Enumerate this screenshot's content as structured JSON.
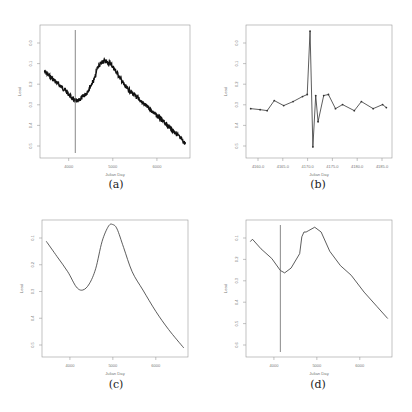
{
  "chart_data": [
    {
      "id": "a",
      "type": "line",
      "caption": "(a)",
      "title": "",
      "xlabel": "Julian Day",
      "ylabel": "Lead",
      "x_ticks": [
        "4000",
        "5000",
        "6000"
      ],
      "y_ticks": [
        "0.0",
        "0.1",
        "0.2",
        "0.3",
        "0.4",
        "0.5"
      ],
      "grid": false,
      "noisy": true,
      "vline_x": 4150,
      "xlim": [
        3350,
        6750
      ],
      "ylim": [
        0.58,
        -0.08
      ],
      "x": [
        3450,
        3700,
        3950,
        4100,
        4200,
        4400,
        4600,
        4650,
        4800,
        4950,
        5100,
        5300,
        5550,
        5800,
        6100,
        6400,
        6650
      ],
      "values": [
        0.15,
        0.2,
        0.25,
        0.29,
        0.3,
        0.26,
        0.18,
        0.13,
        0.1,
        0.11,
        0.16,
        0.23,
        0.28,
        0.33,
        0.39,
        0.45,
        0.51
      ]
    },
    {
      "id": "b",
      "type": "line",
      "caption": "(b)",
      "title": "",
      "xlabel": "Julian Day",
      "ylabel": "Lead",
      "x_ticks": [
        "4160.0",
        "4165.0",
        "4170.0",
        "4175.0",
        "4180.0",
        "4185.0"
      ],
      "y_ticks": [
        "0.0",
        "0.1",
        "0.2",
        "0.3",
        "0.4",
        "0.5"
      ],
      "grid": false,
      "markers": true,
      "xlim": [
        4157,
        4188
      ],
      "ylim": [
        0.58,
        -0.08
      ],
      "x": [
        4158,
        4160,
        4161.5,
        4163,
        4165,
        4167,
        4169,
        4170,
        4170.6,
        4171.2,
        4171.8,
        4172.3,
        4173.5,
        4174.5,
        4176,
        4177.5,
        4180,
        4181.5,
        4184,
        4186,
        4186.8
      ],
      "values": [
        0.335,
        0.34,
        0.345,
        0.295,
        0.32,
        0.3,
        0.275,
        0.265,
        -0.05,
        0.525,
        0.27,
        0.4,
        0.27,
        0.265,
        0.335,
        0.315,
        0.345,
        0.3,
        0.335,
        0.315,
        0.33
      ]
    },
    {
      "id": "c",
      "type": "line",
      "caption": "(c)",
      "title": "",
      "xlabel": "Julian Day",
      "ylabel": "Lead",
      "x_ticks": [
        "4000",
        "5000",
        "6000"
      ],
      "y_ticks": [
        "0.1",
        "0.2",
        "0.3",
        "0.4",
        "0.5"
      ],
      "grid": false,
      "smooth": true,
      "xlim": [
        3350,
        6750
      ],
      "ylim": [
        0.52,
        0.07
      ],
      "x": [
        3450,
        3700,
        3950,
        4150,
        4300,
        4450,
        4600,
        4750,
        4900,
        5000,
        5100,
        5250,
        5450,
        5700,
        6000,
        6300,
        6650
      ],
      "values": [
        0.14,
        0.19,
        0.24,
        0.29,
        0.3,
        0.28,
        0.23,
        0.14,
        0.09,
        0.085,
        0.1,
        0.16,
        0.24,
        0.3,
        0.37,
        0.43,
        0.49
      ]
    },
    {
      "id": "d",
      "type": "line",
      "caption": "(d)",
      "title": "",
      "xlabel": "Julian Day",
      "ylabel": "Lead",
      "x_ticks": [
        "4000",
        "5000",
        "6000"
      ],
      "y_ticks": [
        "0.1",
        "0.2",
        "0.3",
        "0.4",
        "0.5",
        "0.6"
      ],
      "grid": false,
      "vline_x": 4150,
      "xlim": [
        3350,
        6750
      ],
      "ylim": [
        0.62,
        0.05
      ],
      "x": [
        3450,
        3500,
        3700,
        3950,
        4150,
        4250,
        4400,
        4600,
        4650,
        4700,
        4750,
        4800,
        4950,
        5100,
        5300,
        5550,
        5800,
        6100,
        6400,
        6650
      ],
      "values": [
        0.14,
        0.13,
        0.17,
        0.21,
        0.26,
        0.27,
        0.25,
        0.19,
        0.12,
        0.1,
        0.1,
        0.095,
        0.08,
        0.1,
        0.18,
        0.24,
        0.28,
        0.35,
        0.41,
        0.46
      ]
    }
  ]
}
